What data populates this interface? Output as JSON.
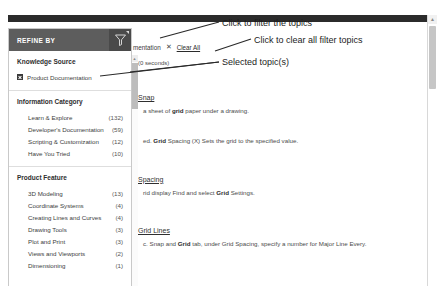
{
  "facet_panel": {
    "header_title": "REFINE BY",
    "filter_icon": "funnel-icon",
    "groups": [
      {
        "title": "Knowledge Source",
        "items": [
          {
            "label": "Product Documentation",
            "count": "",
            "checked": true
          }
        ]
      },
      {
        "title": "Information Category",
        "items": [
          {
            "label": "Learn & Explore",
            "count": "(132)",
            "checked": false
          },
          {
            "label": "Developer's Documentation",
            "count": "(59)",
            "checked": false
          },
          {
            "label": "Scripting & Customization",
            "count": "(12)",
            "checked": false
          },
          {
            "label": "Have You Tried",
            "count": "(10)",
            "checked": false
          }
        ]
      },
      {
        "title": "Product Feature",
        "items": [
          {
            "label": "3D Modeling",
            "count": "(13)",
            "checked": false
          },
          {
            "label": "Coordinate Systems",
            "count": "(4)",
            "checked": false
          },
          {
            "label": "Creating Lines and Curves",
            "count": "(4)",
            "checked": false
          },
          {
            "label": "Drawing Tools",
            "count": "(3)",
            "checked": false
          },
          {
            "label": "Plot and Print",
            "count": "(3)",
            "checked": false
          },
          {
            "label": "Views and Viewports",
            "count": "(2)",
            "checked": false
          },
          {
            "label": "Dimensioning",
            "count": "(1)",
            "checked": false
          }
        ]
      }
    ]
  },
  "selected_filters": {
    "chip_label": "mentation",
    "remove_icon": "close-icon",
    "clear_all_label": "Clear All"
  },
  "results": {
    "timing": "(0 seconds)",
    "items": [
      {
        "title": "Snap",
        "snippet_pre": "a sheet of ",
        "snippet_bold": "grid",
        "snippet_post": " paper under a drawing."
      },
      {
        "title": "",
        "snippet_pre": "ed. ",
        "snippet_bold": "Grid",
        "snippet_post": " Spacing (X) Sets the grid to the specified value."
      },
      {
        "title": "Spacing",
        "snippet_pre": "rid display Find and select ",
        "snippet_bold": "Grid",
        "snippet_post": " Settings."
      },
      {
        "title": "Grid Lines",
        "snippet_pre": "c. Snap and ",
        "snippet_bold": "Grid",
        "snippet_post": " tab, under Grid Spacing, specify a number for Major Line Every."
      }
    ]
  },
  "annotations": {
    "filter_topics": "Click to filter the topics",
    "clear_all_topics": "Click to clear all filter topics",
    "selected_topics": "Selected topic(s)"
  },
  "colors": {
    "header_bg": "#5d5d5d",
    "icon_box_bg": "#4a4a4a",
    "top_bar": "#2b2b2b",
    "annotation": "#1c1c1c"
  }
}
